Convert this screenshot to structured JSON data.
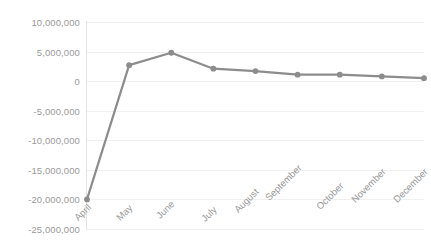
{
  "chart_data": {
    "type": "line",
    "title": "",
    "subtitle": "",
    "xlabel": "",
    "ylabel": "",
    "categories": [
      "April",
      "May",
      "June",
      "July",
      "August",
      "September",
      "October",
      "November",
      "December"
    ],
    "values": [
      -20000000,
      2700000,
      4800000,
      2100000,
      1700000,
      1100000,
      1100000,
      800000,
      500000
    ],
    "series": [
      {
        "name": "",
        "values": [
          -20000000,
          2700000,
          4800000,
          2100000,
          1700000,
          1100000,
          1100000,
          800000,
          500000
        ]
      }
    ],
    "ylim": [
      -25000000,
      10000000
    ],
    "ytick_values": [
      10000000,
      5000000,
      0,
      -5000000,
      -10000000,
      -15000000,
      -20000000,
      -25000000
    ],
    "ytick_labels": [
      "10,000,000",
      "5,000,000",
      "0",
      "-5,000,000",
      "-10,000,000",
      "-15,000,000",
      "-20,000,000",
      "-25,000,000"
    ],
    "grid": true,
    "grid_axis": "y",
    "legend": false,
    "legend_position": "none",
    "marker": "circle",
    "colors": {
      "series_line": "#8c8c8c",
      "marker": "#8c8c8c",
      "gridline": "#f0f0f0",
      "axis_line": "#e3e3e3",
      "tick_label": "#9a9a9a",
      "plot_background": "#ffffff"
    },
    "x_tick_label_rotation": -45
  }
}
